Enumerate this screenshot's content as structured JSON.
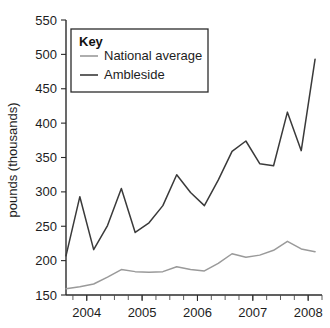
{
  "chart_data": {
    "type": "line",
    "title": "",
    "xlabel": "",
    "ylabel": "pounds (thousands)",
    "ylim": [
      150,
      550
    ],
    "xlim": [
      2003.625,
      2008.25
    ],
    "y_ticks": [
      150,
      200,
      250,
      300,
      350,
      400,
      450,
      500,
      550
    ],
    "x_ticks": [
      2004,
      2005,
      2006,
      2007,
      2008
    ],
    "x_minor_interval": 0.25,
    "grid": false,
    "legend_position": "top-left",
    "legend_title": "Key",
    "x": [
      2003.625,
      2003.875,
      2004.125,
      2004.375,
      2004.625,
      2004.875,
      2005.125,
      2005.375,
      2005.625,
      2005.875,
      2006.125,
      2006.375,
      2006.625,
      2006.875,
      2007.125,
      2007.375,
      2007.625,
      2007.875,
      2008.125
    ],
    "series": [
      {
        "name": "National average",
        "color": "#9a9a9a",
        "values": [
          159,
          162,
          166,
          176,
          187,
          184,
          183,
          184,
          191,
          187,
          185,
          196,
          210,
          205,
          208,
          215,
          228,
          217,
          213
        ]
      },
      {
        "name": "Ambleside",
        "color": "#3a3a3a",
        "values": [
          207,
          293,
          216,
          251,
          305,
          241,
          255,
          280,
          325,
          299,
          280,
          317,
          359,
          374,
          341,
          338,
          416,
          360,
          493
        ]
      }
    ]
  },
  "legend": {
    "title": "Key",
    "items": [
      {
        "label": "National average",
        "color": "#9a9a9a"
      },
      {
        "label": "Ambleside",
        "color": "#3a3a3a"
      }
    ]
  },
  "axes": {
    "y_label": "pounds (thousands)",
    "y_tick_labels": [
      "550",
      "500",
      "450",
      "400",
      "350",
      "300",
      "250",
      "200",
      "150"
    ],
    "x_tick_labels": [
      "2004",
      "2005",
      "2006",
      "2007",
      "2008"
    ]
  }
}
